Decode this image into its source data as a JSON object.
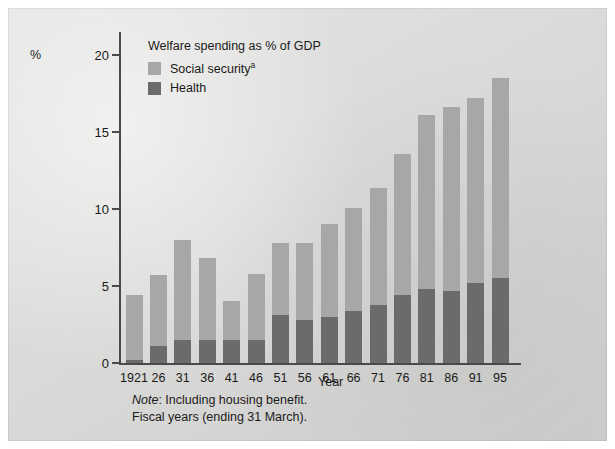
{
  "figure": {
    "y_axis_unit": "%",
    "x_axis_title": "Year",
    "legend_title": "Welfare spending as % of GDP",
    "legend": [
      {
        "label": "Social security",
        "superscript": "a",
        "color": "#a7a7a5",
        "key": "social_security"
      },
      {
        "label": "Health",
        "superscript": "",
        "color": "#6b6b6b",
        "key": "health"
      }
    ],
    "note_label": "Note",
    "note_line1": ": Including housing benefit.",
    "note_line2": "Fiscal years (ending 31 March)."
  },
  "chart_data": {
    "type": "bar",
    "stacked": true,
    "title": "Welfare spending as % of GDP",
    "xlabel": "Year",
    "ylabel": "%",
    "ylim": [
      0,
      21.5
    ],
    "yticks": [
      0,
      5,
      10,
      15,
      20
    ],
    "ytick_labels": [
      "0",
      "5",
      "10",
      "15",
      "20"
    ],
    "grid": false,
    "legend_position": "top-left inside",
    "categories": [
      "1921",
      "26",
      "31",
      "36",
      "41",
      "46",
      "51",
      "56",
      "61",
      "66",
      "71",
      "76",
      "81",
      "86",
      "91",
      "95"
    ],
    "series": [
      {
        "name": "Health",
        "color": "#6b6b6b",
        "values": [
          0.2,
          1.1,
          1.5,
          1.5,
          1.5,
          1.5,
          3.1,
          2.8,
          3.0,
          3.4,
          3.8,
          4.4,
          4.8,
          4.7,
          5.2,
          5.5
        ]
      },
      {
        "name": "Social security",
        "color": "#a7a7a5",
        "values": [
          4.2,
          4.6,
          6.5,
          5.3,
          2.5,
          4.3,
          4.7,
          5.0,
          6.0,
          6.7,
          7.6,
          9.2,
          11.3,
          11.9,
          12.0,
          13.0
        ]
      }
    ],
    "totals": [
      4.4,
      5.7,
      8.0,
      6.8,
      4.0,
      5.8,
      7.8,
      7.8,
      9.0,
      10.1,
      11.4,
      13.6,
      16.1,
      16.6,
      17.2,
      18.5
    ],
    "annotations": [
      "Note: Including housing benefit.",
      "Fiscal years (ending 31 March)."
    ]
  }
}
